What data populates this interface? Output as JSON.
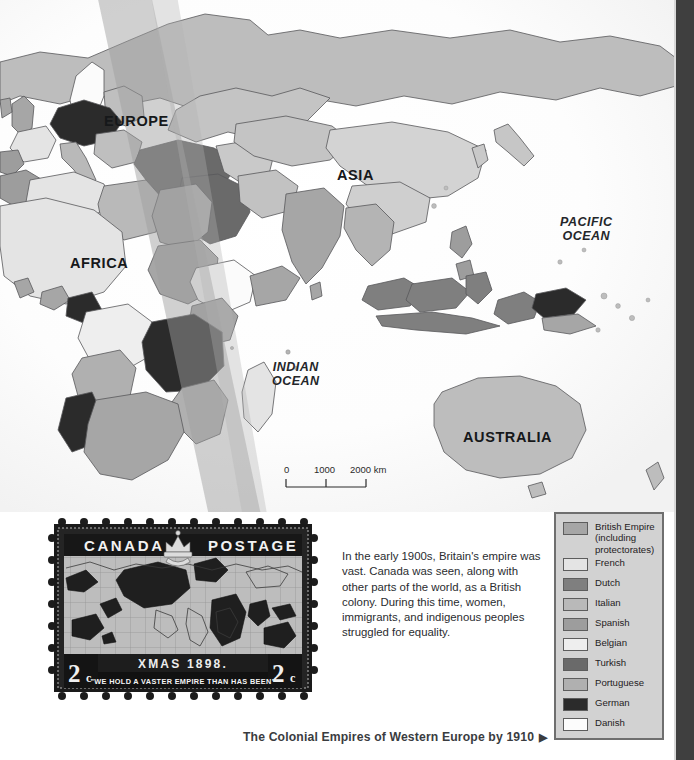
{
  "map": {
    "continent_labels": [
      {
        "name": "europe",
        "text": "EUROPE",
        "x": 104,
        "y": 113
      },
      {
        "name": "africa",
        "text": "AFRICA",
        "x": 70,
        "y": 255
      },
      {
        "name": "asia",
        "text": "ASIA",
        "x": 337,
        "y": 167
      },
      {
        "name": "australia",
        "text": "AUSTRALIA",
        "x": 463,
        "y": 429
      }
    ],
    "ocean_labels": [
      {
        "name": "pacific-ocean",
        "text": "PACIFIC\nOCEAN",
        "x": 560,
        "y": 222
      },
      {
        "name": "indian-ocean",
        "text": "INDIAN\nOCEAN",
        "x": 280,
        "y": 366
      }
    ],
    "scale_bar": {
      "ticks": [
        "0",
        "1000",
        "2000 km"
      ],
      "unit": "km"
    }
  },
  "stamp": {
    "country": "CANADA",
    "denomination_left": "2",
    "denomination_left_unit": "c",
    "denomination_right": "2",
    "denomination_right_unit": "c",
    "postage_word": "POSTAGE",
    "date_line": "XMAS 1898.",
    "motto": "\"WE HOLD A VASTER EMPIRE THAN HAS BEEN\""
  },
  "blurb": {
    "text": "In the early 1900s, Britain's empire was vast. Canada was seen, along with other parts of the world, as a British colony. During this time, women, immigrants, and indigenous peoples struggled for equality."
  },
  "legend": {
    "items": [
      {
        "label": "British Empire\n(including\nprotectorates)",
        "color": "#a6a6a6"
      },
      {
        "label": "French",
        "color": "#e4e4e4"
      },
      {
        "label": "Dutch",
        "color": "#7f7f7f"
      },
      {
        "label": "Italian",
        "color": "#b9b9b9"
      },
      {
        "label": "Spanish",
        "color": "#9d9d9d"
      },
      {
        "label": "Belgian",
        "color": "#eeeeee"
      },
      {
        "label": "Turkish",
        "color": "#6a6a6a"
      },
      {
        "label": "Portuguese",
        "color": "#b0b0b0"
      },
      {
        "label": "German",
        "color": "#2b2b2b"
      },
      {
        "label": "Danish",
        "color": "#fcfcfc"
      }
    ]
  },
  "caption": {
    "text": "The Colonial Empires of Western Europe by 1910",
    "arrow": "▶"
  }
}
